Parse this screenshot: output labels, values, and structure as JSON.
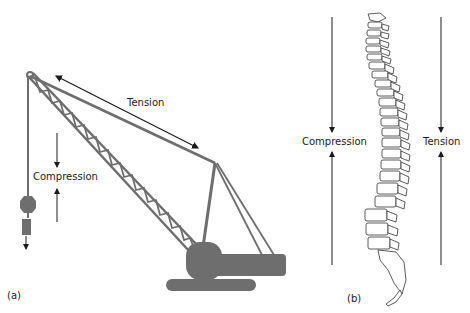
{
  "panel_a": {
    "caption": "(a)",
    "tension_label": "Tension",
    "compression_label": "Compression",
    "crane_color": "#6e6e6e"
  },
  "panel_b": {
    "caption": "(b)",
    "compression_label": "Compression",
    "tension_label": "Tension"
  },
  "colors": {
    "arrow": "#1a1a1a",
    "crane": "#6e6e6e",
    "spine_outline": "#333333"
  }
}
